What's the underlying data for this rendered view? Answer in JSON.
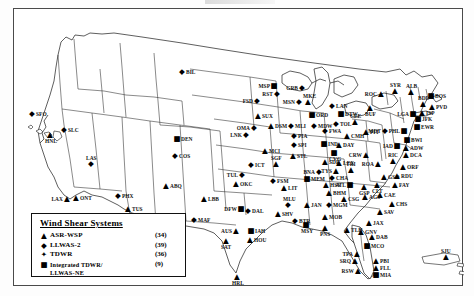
{
  "figure": {
    "frame": true
  },
  "legend": {
    "title": "Wind Shear Systems",
    "rows": [
      {
        "symbol": "▲",
        "symbol_name": "triangle-marker",
        "label": "ASR-WSP",
        "count": "(34)"
      },
      {
        "symbol": "◆",
        "symbol_name": "diamond-marker",
        "label": "LLWAS-2",
        "count": "(39)"
      },
      {
        "symbol": "✦",
        "symbol_name": "star-marker",
        "label": "TDWR",
        "count": "(36)"
      },
      {
        "symbol": "■",
        "symbol_name": "square-marker",
        "label": "Integrated TDWR/",
        "count": "(9)"
      }
    ],
    "continuation": "LLWAS-NE"
  },
  "sites": [
    {
      "id": "BIL",
      "sym": "◆",
      "x": 168,
      "y": 63,
      "pos": "r"
    },
    {
      "id": "SLC",
      "sym": "◆",
      "x": 50,
      "y": 121,
      "pos": "r"
    },
    {
      "id": "SFO",
      "sym": "◆",
      "x": 18,
      "y": 105,
      "pos": "r"
    },
    {
      "id": "LAX",
      "sym": "▲",
      "x": 53,
      "y": 190,
      "pos": "l"
    },
    {
      "id": "ONT",
      "sym": "▲",
      "x": 62,
      "y": 189,
      "pos": "r"
    },
    {
      "id": "LAS",
      "sym": "◆",
      "x": 77,
      "y": 155,
      "pos": "t"
    },
    {
      "id": "PHX",
      "sym": "◆",
      "x": 104,
      "y": 187,
      "pos": "r"
    },
    {
      "id": "TUS",
      "sym": "▲",
      "x": 114,
      "y": 200,
      "pos": "r"
    },
    {
      "id": "HNL",
      "sym": "▲",
      "x": 36,
      "y": 126,
      "pos": "b"
    },
    {
      "id": "DEN",
      "sym": "■",
      "x": 163,
      "y": 130,
      "pos": "r"
    },
    {
      "id": "COS",
      "sym": "◆",
      "x": 161,
      "y": 147,
      "pos": "r"
    },
    {
      "id": "ABQ",
      "sym": "▲",
      "x": 152,
      "y": 177,
      "pos": "r"
    },
    {
      "id": "ELP",
      "sym": "◆",
      "x": 142,
      "y": 215,
      "pos": "r"
    },
    {
      "id": "LBB",
      "sym": "▲",
      "x": 190,
      "y": 190,
      "pos": "r"
    },
    {
      "id": "MAF",
      "sym": "◆",
      "x": 180,
      "y": 211,
      "pos": "r"
    },
    {
      "id": "FSD",
      "sym": "◆",
      "x": 243,
      "y": 92,
      "pos": "l"
    },
    {
      "id": "SUX",
      "sym": "▲",
      "x": 244,
      "y": 107,
      "pos": "r"
    },
    {
      "id": "OMA",
      "sym": "◆",
      "x": 240,
      "y": 119,
      "pos": "l"
    },
    {
      "id": "LNK",
      "sym": "◆",
      "x": 232,
      "y": 126,
      "pos": "l"
    },
    {
      "id": "ICT",
      "sym": "◆",
      "x": 237,
      "y": 156,
      "pos": "r"
    },
    {
      "id": "MCI",
      "sym": "▲",
      "x": 251,
      "y": 142,
      "pos": "r"
    },
    {
      "id": "SGF",
      "sym": "▲",
      "x": 262,
      "y": 155,
      "pos": "t"
    },
    {
      "id": "TUL",
      "sym": "◆",
      "x": 228,
      "y": 166,
      "pos": "l"
    },
    {
      "id": "OKC",
      "sym": "▲",
      "x": 222,
      "y": 175,
      "pos": "r"
    },
    {
      "id": "FSM",
      "sym": "◆",
      "x": 259,
      "y": 172,
      "pos": "r"
    },
    {
      "id": "LIT",
      "sym": "▲",
      "x": 270,
      "y": 179,
      "pos": "r"
    },
    {
      "id": "MLU",
      "sym": "◆",
      "x": 274,
      "y": 196,
      "pos": "t"
    },
    {
      "id": "SHV",
      "sym": "▲",
      "x": 264,
      "y": 205,
      "pos": "r"
    },
    {
      "id": "BTR",
      "sym": "◆",
      "x": 281,
      "y": 212,
      "pos": "r"
    },
    {
      "id": "MSY",
      "sym": "■",
      "x": 292,
      "y": 216,
      "pos": "b"
    },
    {
      "id": "DFW",
      "sym": "■",
      "x": 227,
      "y": 200,
      "pos": "l"
    },
    {
      "id": "DAL",
      "sym": "◆",
      "x": 234,
      "y": 202,
      "pos": "r"
    },
    {
      "id": "AUS",
      "sym": "▲",
      "x": 222,
      "y": 222,
      "pos": "l"
    },
    {
      "id": "SAT",
      "sym": "▲",
      "x": 212,
      "y": 232,
      "pos": "b"
    },
    {
      "id": "IAH",
      "sym": "■",
      "x": 237,
      "y": 222,
      "pos": "r"
    },
    {
      "id": "HOU",
      "sym": "▲",
      "x": 236,
      "y": 231,
      "pos": "r"
    },
    {
      "id": "HRL",
      "sym": "▲",
      "x": 223,
      "y": 268,
      "pos": "b"
    },
    {
      "id": "MSP",
      "sym": "■",
      "x": 260,
      "y": 77,
      "pos": "l"
    },
    {
      "id": "RST",
      "sym": "◆",
      "x": 263,
      "y": 85,
      "pos": "l"
    },
    {
      "id": "GRB",
      "sym": "◆",
      "x": 288,
      "y": 79,
      "pos": "l"
    },
    {
      "id": "MKE",
      "sym": "▲",
      "x": 294,
      "y": 93,
      "pos": "t"
    },
    {
      "id": "MSN",
      "sym": "◆",
      "x": 285,
      "y": 93,
      "pos": "l"
    },
    {
      "id": "DSM",
      "sym": "▲",
      "x": 257,
      "y": 117,
      "pos": "r"
    },
    {
      "id": "MLI",
      "sym": "◆",
      "x": 277,
      "y": 117,
      "pos": "r"
    },
    {
      "id": "PIA",
      "sym": "◆",
      "x": 280,
      "y": 127,
      "pos": "r"
    },
    {
      "id": "SPI",
      "sym": "◆",
      "x": 280,
      "y": 136,
      "pos": "r"
    },
    {
      "id": "STL",
      "sym": "▲",
      "x": 279,
      "y": 147,
      "pos": "r"
    },
    {
      "id": "ORD",
      "sym": "■",
      "x": 298,
      "y": 106,
      "pos": "r"
    },
    {
      "id": "MDW",
      "sym": "◆",
      "x": 300,
      "y": 117,
      "pos": "r"
    },
    {
      "id": "IND",
      "sym": "■",
      "x": 310,
      "y": 135,
      "pos": "r"
    },
    {
      "id": "FWA",
      "sym": "◆",
      "x": 311,
      "y": 122,
      "pos": "r"
    },
    {
      "id": "SDF",
      "sym": "▲",
      "x": 311,
      "y": 153,
      "pos": "r"
    },
    {
      "id": "LEX",
      "sym": "▲",
      "x": 325,
      "y": 154,
      "pos": "r"
    },
    {
      "id": "CVG",
      "sym": "■",
      "x": 320,
      "y": 144,
      "pos": "b"
    },
    {
      "id": "DAY",
      "sym": "▲",
      "x": 325,
      "y": 136,
      "pos": "r"
    },
    {
      "id": "CMH",
      "sym": "▲",
      "x": 333,
      "y": 127,
      "pos": "r"
    },
    {
      "id": "TOL",
      "sym": "◆",
      "x": 322,
      "y": 115,
      "pos": "r"
    },
    {
      "id": "DTW",
      "sym": "■",
      "x": 327,
      "y": 105,
      "pos": "r"
    },
    {
      "id": "LAN",
      "sym": "◆",
      "x": 318,
      "y": 97,
      "pos": "r"
    },
    {
      "id": "CLE",
      "sym": "▲",
      "x": 341,
      "y": 113,
      "pos": "t"
    },
    {
      "id": "PIT",
      "sym": "▲",
      "x": 352,
      "y": 123,
      "pos": "r"
    },
    {
      "id": "BUF",
      "sym": "▲",
      "x": 356,
      "y": 99,
      "pos": "b"
    },
    {
      "id": "ROC",
      "sym": "▲",
      "x": 367,
      "y": 85,
      "pos": "l"
    },
    {
      "id": "SYR",
      "sym": "▲",
      "x": 381,
      "y": 82,
      "pos": "t"
    },
    {
      "id": "ALB",
      "sym": "▲",
      "x": 397,
      "y": 83,
      "pos": "t"
    },
    {
      "id": "BOS",
      "sym": "■",
      "x": 417,
      "y": 87,
      "pos": "r"
    },
    {
      "id": "PVD",
      "sym": "▲",
      "x": 418,
      "y": 98,
      "pos": "r"
    },
    {
      "id": "BDL",
      "sym": "▲",
      "x": 409,
      "y": 95,
      "pos": "t"
    },
    {
      "id": "JFK",
      "sym": "■",
      "x": 404,
      "y": 110,
      "pos": "r"
    },
    {
      "id": "LGA",
      "sym": "■",
      "x": 399,
      "y": 105,
      "pos": "l"
    },
    {
      "id": "EWR",
      "sym": "■",
      "x": 403,
      "y": 118,
      "pos": "r"
    },
    {
      "id": "ISP",
      "sym": "▲",
      "x": 408,
      "y": 104,
      "pos": "r"
    },
    {
      "id": "MDT",
      "sym": "◆",
      "x": 371,
      "y": 122,
      "pos": "l"
    },
    {
      "id": "PHL",
      "sym": "■",
      "x": 390,
      "y": 122,
      "pos": "l"
    },
    {
      "id": "BWI",
      "sym": "■",
      "x": 393,
      "y": 131,
      "pos": "r"
    },
    {
      "id": "ADW",
      "sym": "▲",
      "x": 392,
      "y": 139,
      "pos": "r"
    },
    {
      "id": "DCA",
      "sym": "▲",
      "x": 392,
      "y": 146,
      "pos": "r"
    },
    {
      "id": "IAD",
      "sym": "■",
      "x": 383,
      "y": 137,
      "pos": "l"
    },
    {
      "id": "RIC",
      "sym": "▲",
      "x": 379,
      "y": 152,
      "pos": "t"
    },
    {
      "id": "ORF",
      "sym": "▲",
      "x": 389,
      "y": 158,
      "pos": "r"
    },
    {
      "id": "ROA",
      "sym": "▲",
      "x": 364,
      "y": 155,
      "pos": "l"
    },
    {
      "id": "CRW",
      "sym": "▲",
      "x": 352,
      "y": 146,
      "pos": "l"
    },
    {
      "id": "GSO",
      "sym": "▲",
      "x": 370,
      "y": 168,
      "pos": "r"
    },
    {
      "id": "RDU",
      "sym": "▲",
      "x": 383,
      "y": 167,
      "pos": "r"
    },
    {
      "id": "CLT",
      "sym": "▲",
      "x": 363,
      "y": 176,
      "pos": "b"
    },
    {
      "id": "FAY",
      "sym": "▲",
      "x": 381,
      "y": 176,
      "pos": "r"
    },
    {
      "id": "GSP",
      "sym": "▲",
      "x": 350,
      "y": 178,
      "pos": "b"
    },
    {
      "id": "CAE",
      "sym": "▲",
      "x": 366,
      "y": 186,
      "pos": "r"
    },
    {
      "id": "CHS",
      "sym": "▲",
      "x": 378,
      "y": 195,
      "pos": "r"
    },
    {
      "id": "SAV",
      "sym": "▲",
      "x": 366,
      "y": 203,
      "pos": "r"
    },
    {
      "id": "AGS",
      "sym": "▲",
      "x": 351,
      "y": 188,
      "pos": "r"
    },
    {
      "id": "ATL",
      "sym": "■",
      "x": 336,
      "y": 176,
      "pos": "l"
    },
    {
      "id": "CSG",
      "sym": "▲",
      "x": 330,
      "y": 190,
      "pos": "r"
    },
    {
      "id": "BHM",
      "sym": "▲",
      "x": 315,
      "y": 184,
      "pos": "r"
    },
    {
      "id": "MGM",
      "sym": "◆",
      "x": 315,
      "y": 196,
      "pos": "r"
    },
    {
      "id": "MOB",
      "sym": "▲",
      "x": 311,
      "y": 208,
      "pos": "r"
    },
    {
      "id": "JAN",
      "sym": "▲",
      "x": 293,
      "y": 196,
      "pos": "r"
    },
    {
      "id": "PNS",
      "sym": "▲",
      "x": 311,
      "y": 219,
      "pos": "b"
    },
    {
      "id": "TLH",
      "sym": "▲",
      "x": 333,
      "y": 221,
      "pos": "r"
    },
    {
      "id": "MEM",
      "sym": "■",
      "x": 293,
      "y": 170,
      "pos": "r"
    },
    {
      "id": "CHA",
      "sym": "◆",
      "x": 318,
      "y": 169,
      "pos": "r"
    },
    {
      "id": "BNA",
      "sym": "◆",
      "x": 305,
      "y": 163,
      "pos": "l"
    },
    {
      "id": "TYS",
      "sym": "▲",
      "x": 322,
      "y": 162,
      "pos": "l"
    },
    {
      "id": "TRI",
      "sym": "▲",
      "x": 337,
      "y": 161,
      "pos": "t"
    },
    {
      "id": "HSV",
      "sym": "▲",
      "x": 312,
      "y": 176,
      "pos": "r"
    },
    {
      "id": "JAX",
      "sym": "▲",
      "x": 355,
      "y": 214,
      "pos": "r"
    },
    {
      "id": "DAB",
      "sym": "▲",
      "x": 358,
      "y": 228,
      "pos": "r"
    },
    {
      "id": "MCO",
      "sym": "■",
      "x": 353,
      "y": 237,
      "pos": "r"
    },
    {
      "id": "GNV",
      "sym": "▲",
      "x": 347,
      "y": 223,
      "pos": "r"
    },
    {
      "id": "TPA",
      "sym": "▲",
      "x": 343,
      "y": 245,
      "pos": "l"
    },
    {
      "id": "SRQ",
      "sym": "▲",
      "x": 341,
      "y": 252,
      "pos": "l"
    },
    {
      "id": "RSW",
      "sym": "▲",
      "x": 344,
      "y": 262,
      "pos": "l"
    },
    {
      "id": "PBI",
      "sym": "▲",
      "x": 362,
      "y": 252,
      "pos": "r"
    },
    {
      "id": "FLL",
      "sym": "▲",
      "x": 362,
      "y": 259,
      "pos": "r"
    },
    {
      "id": "MIA",
      "sym": "■",
      "x": 362,
      "y": 266,
      "pos": "r"
    },
    {
      "id": "SJU",
      "sym": "▲",
      "x": 432,
      "y": 248,
      "pos": "t"
    }
  ]
}
